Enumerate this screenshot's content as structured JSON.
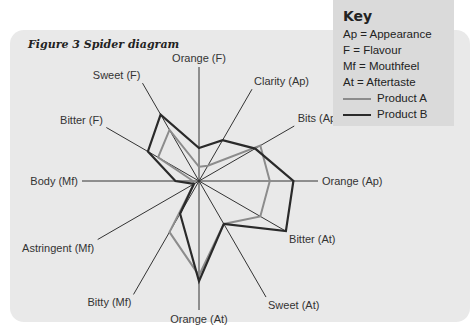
{
  "figure": {
    "title": "Figure 3 Spider diagram"
  },
  "key": {
    "title": "Key",
    "abbreviations": [
      "Ap = Appearance",
      "F = Flavour",
      "Mf = Mouthfeel",
      "At = Aftertaste"
    ],
    "legend": [
      {
        "label": "Product A",
        "color": "#8c8c8c"
      },
      {
        "label": "Product B",
        "color": "#2a2a2a"
      }
    ]
  },
  "chart_data": {
    "type": "radar",
    "title": "Figure 3 Spider diagram",
    "axes": [
      "Orange (F)",
      "Clarity (Ap)",
      "Bits (Ap)",
      "Orange (Ap)",
      "Bitter (At)",
      "Sweet (At)",
      "Orange (At)",
      "Bitty (Mf)",
      "Astringent (Mf)",
      "Body (Mf)",
      "Bitter (F)",
      "Sweet (F)"
    ],
    "range": [
      0,
      10
    ],
    "series": [
      {
        "name": "Product A",
        "color": "#8c8c8c",
        "values": [
          1.2,
          1.5,
          6.0,
          6.0,
          6.0,
          4.2,
          8.0,
          5.0,
          0.5,
          0.5,
          4.0,
          5.0
        ]
      },
      {
        "name": "Product B",
        "color": "#2a2a2a",
        "values": [
          2.8,
          4.0,
          5.5,
          8.0,
          8.5,
          4.2,
          8.5,
          3.2,
          0.5,
          2.0,
          5.0,
          6.5
        ]
      }
    ],
    "legend_position": "top-right",
    "grid": false
  }
}
